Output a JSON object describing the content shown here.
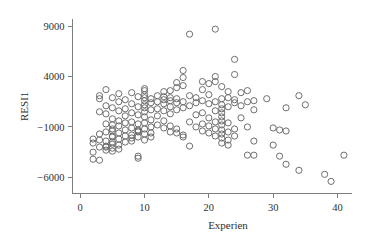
{
  "chart_data": {
    "type": "scatter",
    "title": "",
    "subtitle": "",
    "xlabel": "Experien",
    "ylabel": "RESI1",
    "xlim": [
      -1.2,
      43.5
    ],
    "ylim": [
      -7600,
      10200
    ],
    "xticks": [
      0,
      10,
      20,
      30,
      40
    ],
    "xtick_labels": [
      "0",
      "10",
      "20",
      "30",
      "40"
    ],
    "yticks": [
      9000,
      4000,
      -1000,
      -6000
    ],
    "ytick_labels": [
      "9000",
      "4000",
      "−1000",
      "−6000"
    ],
    "grid": false,
    "legend": null,
    "marker": {
      "shape": "open-circle",
      "radius_px": 3.1,
      "stroke": "#6e6e6e",
      "fill": "none",
      "stroke_width": 1
    },
    "axis_color": "#7d7d7d",
    "background": "#ffffff",
    "n_points": 178,
    "points": [
      [
        2,
        -2200
      ],
      [
        2,
        -2600
      ],
      [
        2,
        -3500
      ],
      [
        2,
        -4200
      ],
      [
        3,
        500
      ],
      [
        3,
        -1700
      ],
      [
        3,
        -2300
      ],
      [
        3,
        -3000
      ],
      [
        3,
        -4300
      ],
      [
        3,
        1800
      ],
      [
        3,
        2100
      ],
      [
        4,
        2700
      ],
      [
        4,
        1100
      ],
      [
        4,
        300
      ],
      [
        4,
        -700
      ],
      [
        4,
        -1500
      ],
      [
        4,
        -2400
      ],
      [
        4,
        -2900
      ],
      [
        4,
        -3300
      ],
      [
        4,
        -3000
      ],
      [
        5,
        1900
      ],
      [
        5,
        900
      ],
      [
        5,
        -200
      ],
      [
        5,
        -800
      ],
      [
        5,
        -1400
      ],
      [
        5,
        -2000
      ],
      [
        5,
        -2700
      ],
      [
        5,
        -3100
      ],
      [
        5,
        -3400
      ],
      [
        5,
        -2500
      ],
      [
        5,
        -1900
      ],
      [
        5,
        -1200
      ],
      [
        6,
        2300
      ],
      [
        6,
        1500
      ],
      [
        6,
        600
      ],
      [
        6,
        -400
      ],
      [
        6,
        -900
      ],
      [
        6,
        -1600
      ],
      [
        6,
        -2200
      ],
      [
        6,
        -2800
      ],
      [
        6,
        -3200
      ],
      [
        7,
        1700
      ],
      [
        7,
        800
      ],
      [
        7,
        100
      ],
      [
        7,
        -600
      ],
      [
        7,
        -1300
      ],
      [
        7,
        -1900
      ],
      [
        7,
        -2500
      ],
      [
        8,
        2400
      ],
      [
        8,
        1300
      ],
      [
        8,
        400
      ],
      [
        8,
        -500
      ],
      [
        8,
        -1100
      ],
      [
        8,
        -1800
      ],
      [
        8,
        -2400
      ],
      [
        8,
        -2100
      ],
      [
        9,
        2000
      ],
      [
        9,
        1000
      ],
      [
        9,
        200
      ],
      [
        9,
        -700
      ],
      [
        9,
        -1300
      ],
      [
        9,
        -1400
      ],
      [
        9,
        -1500
      ],
      [
        9,
        -2000
      ],
      [
        9,
        -4100
      ],
      [
        9,
        -3900
      ],
      [
        10,
        2800
      ],
      [
        10,
        2600
      ],
      [
        10,
        2200
      ],
      [
        10,
        1900
      ],
      [
        10,
        1600
      ],
      [
        10,
        1200
      ],
      [
        10,
        900
      ],
      [
        10,
        500
      ],
      [
        10,
        0
      ],
      [
        10,
        -600
      ],
      [
        10,
        -1200
      ],
      [
        10,
        -1700
      ],
      [
        10,
        -2300
      ],
      [
        11,
        1800
      ],
      [
        11,
        1400
      ],
      [
        11,
        700
      ],
      [
        11,
        -300
      ],
      [
        11,
        -1000
      ],
      [
        11,
        -1600
      ],
      [
        11,
        -2000
      ],
      [
        12,
        2100
      ],
      [
        12,
        1500
      ],
      [
        12,
        800
      ],
      [
        12,
        100
      ],
      [
        12,
        -800
      ],
      [
        13,
        2500
      ],
      [
        13,
        2000
      ],
      [
        13,
        1700
      ],
      [
        13,
        1300
      ],
      [
        13,
        600
      ],
      [
        13,
        -400
      ],
      [
        13,
        -1100
      ],
      [
        14,
        2600
      ],
      [
        14,
        1900
      ],
      [
        14,
        1600
      ],
      [
        14,
        1000
      ],
      [
        14,
        300
      ],
      [
        14,
        -900
      ],
      [
        14,
        -1500
      ],
      [
        15,
        3400
      ],
      [
        15,
        2900
      ],
      [
        15,
        1800
      ],
      [
        15,
        1400
      ],
      [
        15,
        700
      ],
      [
        15,
        -1200
      ],
      [
        15,
        -1600
      ],
      [
        16,
        4600
      ],
      [
        16,
        3900
      ],
      [
        16,
        3100
      ],
      [
        16,
        1500
      ],
      [
        16,
        900
      ],
      [
        16,
        -1800
      ],
      [
        16,
        -2000
      ],
      [
        17,
        8200
      ],
      [
        17,
        2100
      ],
      [
        17,
        1100
      ],
      [
        17,
        -500
      ],
      [
        17,
        -2900
      ],
      [
        18,
        1900
      ],
      [
        18,
        1400
      ],
      [
        18,
        200
      ],
      [
        18,
        -1000
      ],
      [
        19,
        3500
      ],
      [
        19,
        2700
      ],
      [
        19,
        1600
      ],
      [
        19,
        400
      ],
      [
        19,
        -700
      ],
      [
        19,
        -1400
      ],
      [
        20,
        3300
      ],
      [
        20,
        2200
      ],
      [
        20,
        1300
      ],
      [
        20,
        -100
      ],
      [
        20,
        -900
      ],
      [
        20,
        -1600
      ],
      [
        21,
        8700
      ],
      [
        21,
        4000
      ],
      [
        21,
        3500
      ],
      [
        21,
        1500
      ],
      [
        21,
        600
      ],
      [
        21,
        -500
      ],
      [
        21,
        -1200
      ],
      [
        21,
        -1900
      ],
      [
        22,
        3000
      ],
      [
        22,
        1800
      ],
      [
        22,
        1200
      ],
      [
        22,
        800
      ],
      [
        22,
        400
      ],
      [
        22,
        0
      ],
      [
        22,
        -400
      ],
      [
        22,
        -800
      ],
      [
        22,
        -1300
      ],
      [
        22,
        -1700
      ],
      [
        22,
        -2100
      ],
      [
        22,
        -2600
      ],
      [
        23,
        2500
      ],
      [
        23,
        1900
      ],
      [
        23,
        1000
      ],
      [
        23,
        -600
      ],
      [
        23,
        -1500
      ],
      [
        23,
        -2300
      ],
      [
        23,
        -2800
      ],
      [
        24,
        5700
      ],
      [
        24,
        4200
      ],
      [
        24,
        1700
      ],
      [
        24,
        1400
      ],
      [
        24,
        -1200
      ],
      [
        24,
        -1900
      ],
      [
        25,
        2400
      ],
      [
        25,
        1100
      ],
      [
        25,
        -100
      ],
      [
        26,
        2600
      ],
      [
        26,
        1500
      ],
      [
        26,
        -1000
      ],
      [
        26,
        -3800
      ],
      [
        27,
        1600
      ],
      [
        27,
        700
      ],
      [
        27,
        -2400
      ],
      [
        27,
        -3800
      ],
      [
        29,
        1800
      ],
      [
        30,
        -1100
      ],
      [
        30,
        -2800
      ],
      [
        31,
        -1300
      ],
      [
        31,
        -3900
      ],
      [
        32,
        900
      ],
      [
        32,
        -1400
      ],
      [
        32,
        -4700
      ],
      [
        34,
        2100
      ],
      [
        34,
        -5300
      ],
      [
        35,
        1200
      ],
      [
        38,
        -5700
      ],
      [
        39,
        -6400
      ],
      [
        41,
        -3800
      ]
    ]
  }
}
